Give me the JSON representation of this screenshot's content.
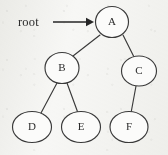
{
  "diagram": {
    "type": "tree",
    "background_color": "#f7f7f5",
    "stroke_color": "#3a3a3a",
    "text_color": "#2b2b2b",
    "annotation": {
      "label": "root",
      "x": 18,
      "y": 15,
      "arrow": {
        "name": "root-pointer-arrow",
        "x1": 53,
        "y1": 22,
        "x2": 94,
        "y2": 22,
        "head": "right"
      }
    },
    "nodes": [
      {
        "id": "A",
        "label": "A",
        "cx": 112,
        "cy": 22,
        "rx": 16.5,
        "ry": 15.5
      },
      {
        "id": "B",
        "label": "B",
        "cx": 62,
        "cy": 68,
        "rx": 17.0,
        "ry": 15.5
      },
      {
        "id": "C",
        "label": "C",
        "cx": 139,
        "cy": 71,
        "rx": 17.5,
        "ry": 15.0
      },
      {
        "id": "D",
        "label": "D",
        "cx": 32,
        "cy": 127,
        "rx": 19.5,
        "ry": 15.5
      },
      {
        "id": "E",
        "label": "E",
        "cx": 81,
        "cy": 127,
        "rx": 19.5,
        "ry": 15.5
      },
      {
        "id": "F",
        "label": "F",
        "cx": 129,
        "cy": 127,
        "rx": 19.0,
        "ry": 15.5
      }
    ],
    "edges": [
      {
        "from": "A",
        "to": "B",
        "x1": 100,
        "y1": 35,
        "x2": 73,
        "y2": 56
      },
      {
        "from": "A",
        "to": "C",
        "x1": 123,
        "y1": 35,
        "x2": 134,
        "y2": 57
      },
      {
        "from": "B",
        "to": "D",
        "x1": 57,
        "y1": 83,
        "x2": 41,
        "y2": 113
      },
      {
        "from": "B",
        "to": "E",
        "x1": 67,
        "y1": 83,
        "x2": 78,
        "y2": 113
      },
      {
        "from": "C",
        "to": "F",
        "x1": 136,
        "y1": 86,
        "x2": 131,
        "y2": 113
      }
    ]
  }
}
